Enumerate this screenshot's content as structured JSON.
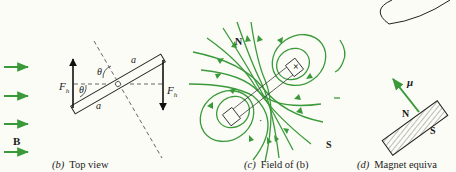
{
  "colors": {
    "background": "#fbfcf6",
    "field_green": "#3a9a3a",
    "ink": "#1a1a1a"
  },
  "panel_b": {
    "caption_letter": "(b)",
    "caption_text": "Top view",
    "field_label": "B",
    "force_label": "F",
    "force_subscript": "h",
    "angle_label": "θ",
    "length_label": "a",
    "field_arrow_count": 4
  },
  "panel_c": {
    "caption_letter": "(c)",
    "caption_text": "Field of (b)",
    "north_label": "N",
    "south_label": "S",
    "current_out_symbol": "·",
    "current_in_symbol": "×"
  },
  "panel_d": {
    "caption_letter": "(d)",
    "caption_text": "Magnet equiva",
    "moment_label": "μ",
    "north_label": "N",
    "south_label": "S"
  }
}
